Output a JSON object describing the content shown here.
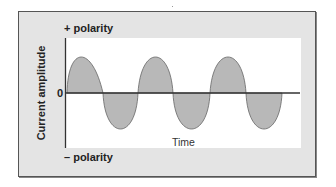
{
  "diagram": {
    "type": "alternating current waveform",
    "labels": {
      "positive": "+ polarity",
      "negative": "– polarity",
      "zero": "0",
      "x_axis": "Time",
      "y_axis": "Current amplitude"
    },
    "waveform": {
      "cycles": 3,
      "fill_color": "#b8b8b8",
      "stroke_color": "#666666",
      "axis_color": "#333333",
      "zero_crossings_px": [
        67,
        103,
        138,
        173,
        210,
        246,
        282
      ],
      "peak_positions_px": [
        80,
        156,
        228
      ],
      "trough_positions_px": [
        120,
        191,
        264
      ]
    },
    "colors": {
      "frame_background": "#e4e4e4",
      "plot_background": "#ffffff",
      "frame_border": "#555555"
    }
  }
}
